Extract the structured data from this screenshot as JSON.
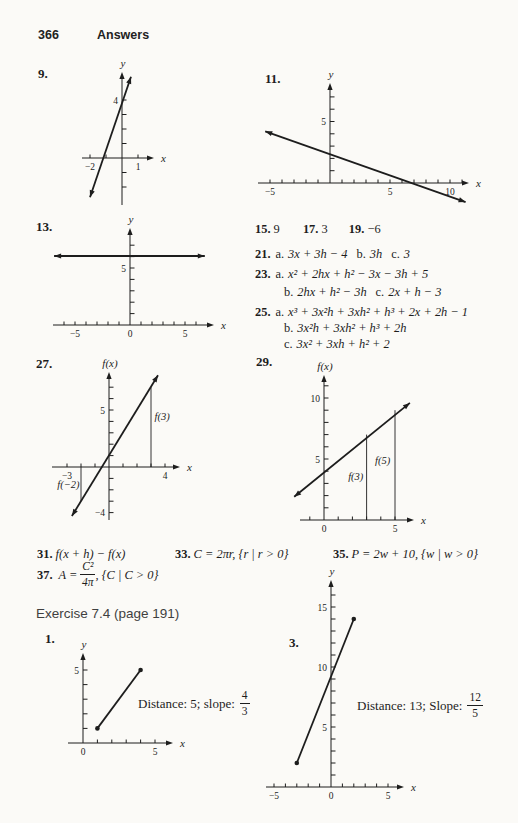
{
  "page": {
    "number": "366",
    "header": "Answers"
  },
  "problems": {
    "p9": "9.",
    "p11": "11.",
    "p13": "13.",
    "p27": "27.",
    "p29": "29.",
    "p1": "1.",
    "p3": "3."
  },
  "section": {
    "exercise_heading": "Exercise 7.4 (page 191)"
  },
  "answers": {
    "row_15_19": [
      {
        "num": "15.",
        "val": "9"
      },
      {
        "num": "17.",
        "val": "3"
      },
      {
        "num": "19.",
        "val": "−6"
      }
    ],
    "a21": {
      "num": "21.",
      "parts": [
        {
          "label": "a.",
          "expr": "3x + 3h − 4"
        },
        {
          "label": "b.",
          "expr": "3h"
        },
        {
          "label": "c.",
          "expr": "3"
        }
      ]
    },
    "a23": {
      "num": "23.",
      "line1": {
        "label": "a.",
        "expr": "x² + 2hx + h² − 3x − 3h + 5"
      },
      "line2": [
        {
          "label": "b.",
          "expr": "2hx + h² − 3h"
        },
        {
          "label": "c.",
          "expr": "2x + h − 3"
        }
      ]
    },
    "a25": {
      "num": "25.",
      "lines": [
        {
          "label": "a.",
          "expr": "x³ + 3x²h + 3xh² + h³ + 2x + 2h − 1"
        },
        {
          "label": "b.",
          "expr": "3x²h + 3xh² + h³ + 2h"
        },
        {
          "label": "c.",
          "expr": "3x² + 3xh + h² + 2"
        }
      ]
    },
    "a31": {
      "num": "31.",
      "expr": "f(x + h) − f(x)"
    },
    "a33": {
      "num": "33.",
      "expr": "C = 2πr, {r | r > 0}"
    },
    "a35": {
      "num": "35.",
      "expr": "P = 2w + 10, {w | w > 0}"
    },
    "a37": {
      "num": "37.",
      "expr_pre": "A = ",
      "frac": {
        "num": "C²",
        "den": "4π"
      },
      "expr_post": ", {C | C > 0}"
    }
  },
  "annotations": {
    "p1": {
      "text": "Distance: 5; slope:",
      "frac": {
        "num": "4",
        "den": "3"
      }
    },
    "p3": {
      "text": "Distance: 13; Slope:",
      "frac": {
        "num": "12",
        "den": "5"
      }
    }
  },
  "chart_data": [
    {
      "id": "g9",
      "type": "line",
      "xlabel": "x",
      "ylabel": "y",
      "ticks_x": [
        -2,
        -1,
        1
      ],
      "labels_x": [
        {
          "v": -2,
          "t": "−2"
        },
        {
          "v": 1,
          "t": "1"
        }
      ],
      "ticks_y": [
        -2,
        -1,
        1,
        2,
        3,
        4
      ],
      "labels_y": [
        {
          "v": 4,
          "t": "4"
        }
      ],
      "lines": [
        {
          "x1": -2.0,
          "y1": -2.7,
          "x2": 0.56,
          "y2": 5.6,
          "arrows": "both"
        }
      ]
    },
    {
      "id": "g11",
      "type": "line",
      "xlabel": "x",
      "ylabel": "y",
      "ticks_x": [
        -5,
        -4,
        -3,
        -2,
        -1,
        1,
        2,
        3,
        4,
        5,
        6,
        7,
        8,
        9,
        10,
        11
      ],
      "labels_x": [
        {
          "v": -5,
          "t": "−5"
        },
        {
          "v": 5,
          "t": "5"
        },
        {
          "v": 10,
          "t": "10"
        }
      ],
      "ticks_y": [
        1,
        2,
        3,
        4,
        5,
        6,
        7
      ],
      "labels_y": [
        {
          "v": 5,
          "t": "5"
        }
      ],
      "lines": [
        {
          "x1": -5.4,
          "y1": 4.2,
          "x2": 11.3,
          "y2": -1.55,
          "arrows": "both"
        }
      ]
    },
    {
      "id": "g13",
      "type": "line",
      "xlabel": "x",
      "ylabel": "y",
      "ticks_x": [
        -6,
        -5,
        -4,
        -3,
        -2,
        -1,
        1,
        2,
        3,
        4,
        5,
        6
      ],
      "labels_x": [
        {
          "v": -5,
          "t": "−5"
        },
        {
          "v": 0,
          "t": "0"
        },
        {
          "v": 5,
          "t": "5"
        }
      ],
      "ticks_y": [
        1,
        2,
        3,
        4,
        5,
        6,
        7
      ],
      "labels_y": [
        {
          "v": 5,
          "t": "5"
        }
      ],
      "lines": [
        {
          "x1": -6.9,
          "y1": 6.05,
          "x2": 6.8,
          "y2": 6.05,
          "arrows": "both"
        }
      ]
    },
    {
      "id": "g27",
      "type": "line",
      "xlabel": "x",
      "ylabel": "f(x)",
      "ticks_x": [
        -3,
        -2,
        -1,
        1,
        2,
        3,
        4
      ],
      "labels_x": [
        {
          "v": -3,
          "t": "−3"
        },
        {
          "v": 4,
          "t": "4"
        }
      ],
      "ticks_y": [
        -4,
        -3,
        -2,
        -1,
        1,
        2,
        3,
        4,
        5,
        6,
        7
      ],
      "labels_y": [
        {
          "v": 5,
          "t": "5"
        },
        {
          "v": -4,
          "t": "−4"
        }
      ],
      "lines": [
        {
          "x1": -2.65,
          "y1": -4.3,
          "x2": 3.5,
          "y2": 8.05,
          "arrows": "both"
        }
      ],
      "vsegs": [
        {
          "x": 3,
          "top": 7,
          "label": "f(3)",
          "lx": 3.25,
          "ly": 4.1,
          "anchor": "start"
        },
        {
          "x": -2,
          "top": -3,
          "label": "f(−2)",
          "lx": -2.1,
          "ly": -1.8,
          "anchor": "end"
        }
      ]
    },
    {
      "id": "g29",
      "type": "line",
      "xlabel": "x",
      "ylabel": "f(x)",
      "ticks_x": [
        -1,
        1,
        2,
        3,
        4,
        5
      ],
      "labels_x": [
        {
          "v": 0,
          "t": "0"
        },
        {
          "v": 5,
          "t": "5"
        }
      ],
      "ticks_y": [
        1,
        2,
        3,
        4,
        5,
        6,
        7,
        8,
        9,
        10,
        11
      ],
      "labels_y": [
        {
          "v": 5,
          "t": "5"
        },
        {
          "v": 10,
          "t": "10"
        }
      ],
      "lines": [
        {
          "x1": -2.1,
          "y1": 1.9,
          "x2": 6.05,
          "y2": 9.6,
          "arrows": "both"
        }
      ],
      "vsegs": [
        {
          "x": 3,
          "top": 7,
          "label": "f(3)",
          "lx": 1.7,
          "ly": 3.3,
          "anchor": "start"
        },
        {
          "x": 5,
          "top": 9,
          "label": "f(5)",
          "lx": 3.6,
          "ly": 4.6,
          "anchor": "start"
        }
      ]
    },
    {
      "id": "g1",
      "type": "line",
      "xlabel": "x",
      "ylabel": "y",
      "ticks_x": [
        1,
        2,
        3,
        4,
        5
      ],
      "labels_x": [
        {
          "v": 0,
          "t": "0"
        },
        {
          "v": 5,
          "t": "5"
        }
      ],
      "ticks_y": [
        1,
        2,
        3,
        4,
        5
      ],
      "labels_y": [
        {
          "v": 5,
          "t": "5"
        }
      ],
      "lines": [
        {
          "x1": 1,
          "y1": 1,
          "x2": 4,
          "y2": 5,
          "arrows": "none",
          "dots": true
        }
      ]
    },
    {
      "id": "g3",
      "type": "line",
      "xlabel": "x",
      "ylabel": "y",
      "ticks_x": [
        -5,
        -4,
        -3,
        -2,
        -1,
        1,
        2,
        3,
        4,
        5
      ],
      "labels_x": [
        {
          "v": -5,
          "t": "−5"
        },
        {
          "v": 0,
          "t": "0"
        },
        {
          "v": 5,
          "t": "5"
        }
      ],
      "ticks_y": [
        1,
        2,
        3,
        4,
        5,
        6,
        7,
        8,
        9,
        10,
        11,
        12,
        13,
        14,
        15,
        16
      ],
      "labels_y": [
        {
          "v": 5,
          "t": "5"
        },
        {
          "v": 10,
          "t": "10"
        },
        {
          "v": 15,
          "t": "15"
        }
      ],
      "lines": [
        {
          "x1": -3,
          "y1": 2,
          "x2": 2,
          "y2": 14,
          "arrows": "none",
          "dots": true
        }
      ]
    }
  ]
}
